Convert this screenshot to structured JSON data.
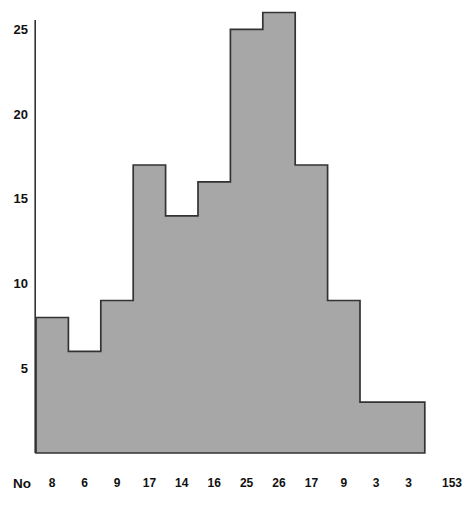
{
  "chart_data": {
    "type": "bar",
    "style": "histogram-step",
    "title": "",
    "xlabel": "",
    "ylabel": "",
    "row_label": "No",
    "values": [
      8,
      6,
      9,
      17,
      14,
      16,
      25,
      26,
      17,
      9,
      3,
      3
    ],
    "total": 153,
    "yticks": [
      5,
      10,
      15,
      20,
      25
    ],
    "ylim": [
      0,
      26.5
    ],
    "grid": false,
    "legend": false,
    "colors": {
      "background": "#ffffff",
      "bar_fill": "#a7a7a7",
      "bar_stroke": "#333333",
      "axis": "#333333",
      "text": "#111111"
    }
  }
}
